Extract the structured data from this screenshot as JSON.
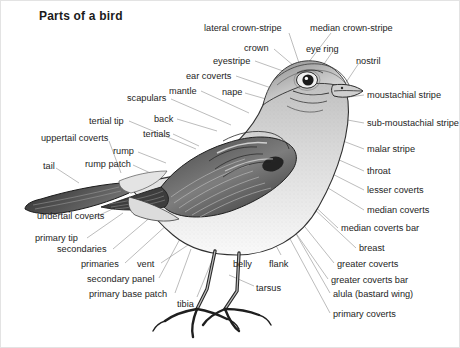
{
  "page": {
    "title": "Parts of a bird",
    "background": "#ffffff",
    "width": 460,
    "height": 348,
    "line_color": "#8e8e8e",
    "text_color": "#242424"
  },
  "labels": [
    {
      "id": "lateral-crown-stripe",
      "text": "lateral crown-stripe",
      "x": 203,
      "y": 22,
      "align": "left",
      "lx": 288,
      "ly": 32,
      "tx": 300,
      "ty": 68
    },
    {
      "id": "median-crown-stripe",
      "text": "median crown-stripe",
      "x": 309,
      "y": 22,
      "align": "left",
      "lx": 330,
      "ly": 32,
      "tx": 307,
      "ty": 62
    },
    {
      "id": "crown",
      "text": "crown",
      "x": 243,
      "y": 42,
      "align": "left",
      "lx": 273,
      "ly": 48,
      "tx": 293,
      "ty": 65
    },
    {
      "id": "eye-ring",
      "text": "eye ring",
      "x": 305,
      "y": 43,
      "align": "left",
      "lx": 332,
      "ly": 50,
      "tx": 316,
      "ty": 73
    },
    {
      "id": "eyestripe",
      "text": "eyestripe",
      "x": 212,
      "y": 55,
      "align": "left",
      "lx": 254,
      "ly": 60,
      "tx": 296,
      "ty": 75
    },
    {
      "id": "nostril",
      "text": "nostril",
      "x": 355,
      "y": 55,
      "align": "left",
      "lx": 358,
      "ly": 62,
      "tx": 344,
      "ty": 83
    },
    {
      "id": "ear-coverts",
      "text": "ear coverts",
      "x": 185,
      "y": 70,
      "align": "left",
      "lx": 235,
      "ly": 75,
      "tx": 285,
      "ty": 92
    },
    {
      "id": "mantle",
      "text": "mantle",
      "x": 168,
      "y": 85,
      "align": "left",
      "lx": 200,
      "ly": 90,
      "tx": 248,
      "ty": 112
    },
    {
      "id": "nape",
      "text": "nape",
      "x": 221,
      "y": 86,
      "align": "left",
      "lx": 244,
      "ly": 92,
      "tx": 272,
      "ty": 100
    },
    {
      "id": "scapulars",
      "text": "scapulars",
      "x": 126,
      "y": 92,
      "align": "left",
      "lx": 170,
      "ly": 98,
      "tx": 230,
      "ty": 124
    },
    {
      "id": "moustachial-stripe",
      "text": "moustachial stripe",
      "x": 366,
      "y": 89,
      "align": "left",
      "lx": 363,
      "ly": 94,
      "tx": 318,
      "ty": 100
    },
    {
      "id": "back",
      "text": "back",
      "x": 153,
      "y": 113,
      "align": "left",
      "lx": 176,
      "ly": 118,
      "tx": 216,
      "ty": 130
    },
    {
      "id": "sub-moustachial-stripe",
      "text": "sub-moustachial stripe",
      "x": 366,
      "y": 117,
      "align": "left",
      "lx": 363,
      "ly": 122,
      "tx": 308,
      "ty": 112
    },
    {
      "id": "tertial-tip",
      "text": "tertial tip",
      "x": 88,
      "y": 115,
      "align": "left",
      "lx": 128,
      "ly": 120,
      "tx": 195,
      "ty": 148
    },
    {
      "id": "tertials",
      "text": "tertials",
      "x": 142,
      "y": 128,
      "align": "left",
      "lx": 172,
      "ly": 133,
      "tx": 198,
      "ty": 145
    },
    {
      "id": "uppertail-coverts",
      "text": "uppertail coverts",
      "x": 40,
      "y": 132,
      "align": "left",
      "lx": 108,
      "ly": 140,
      "tx": 120,
      "ty": 172
    },
    {
      "id": "rump",
      "text": "rump",
      "x": 112,
      "y": 145,
      "align": "left",
      "lx": 137,
      "ly": 151,
      "tx": 165,
      "ty": 162
    },
    {
      "id": "malar-stripe",
      "text": "malar stripe",
      "x": 366,
      "y": 143,
      "align": "left",
      "lx": 363,
      "ly": 148,
      "tx": 300,
      "ty": 124
    },
    {
      "id": "rump-patch",
      "text": "rump patch",
      "x": 84,
      "y": 158,
      "align": "left",
      "lx": 132,
      "ly": 164,
      "tx": 158,
      "ty": 176
    },
    {
      "id": "tail",
      "text": "tail",
      "x": 42,
      "y": 160,
      "align": "left",
      "lx": 55,
      "ly": 167,
      "tx": 78,
      "ty": 182
    },
    {
      "id": "throat",
      "text": "throat",
      "x": 366,
      "y": 165,
      "align": "left",
      "lx": 363,
      "ly": 170,
      "tx": 300,
      "ty": 142
    },
    {
      "id": "lesser-coverts",
      "text": "lesser coverts",
      "x": 366,
      "y": 184,
      "align": "left",
      "lx": 363,
      "ly": 189,
      "tx": 286,
      "ty": 150
    },
    {
      "id": "median-coverts",
      "text": "median coverts",
      "x": 366,
      "y": 204,
      "align": "left",
      "lx": 363,
      "ly": 209,
      "tx": 283,
      "ty": 160
    },
    {
      "id": "undertail-coverts",
      "text": "undertail coverts",
      "x": 36,
      "y": 210,
      "align": "left",
      "lx": 88,
      "ly": 219,
      "tx": 118,
      "ty": 205
    },
    {
      "id": "median-coverts-bar",
      "text": "median coverts bar",
      "x": 340,
      "y": 222,
      "align": "left",
      "lx": 337,
      "ly": 227,
      "tx": 278,
      "ty": 172
    },
    {
      "id": "primary-tip",
      "text": "primary tip",
      "x": 34,
      "y": 232,
      "align": "left",
      "lx": 86,
      "ly": 237,
      "tx": 122,
      "ty": 212
    },
    {
      "id": "breast",
      "text": "breast",
      "x": 358,
      "y": 242,
      "align": "left",
      "lx": 355,
      "ly": 247,
      "tx": 296,
      "ty": 192
    },
    {
      "id": "secondaries",
      "text": "secondaries",
      "x": 56,
      "y": 243,
      "align": "left",
      "lx": 112,
      "ly": 248,
      "tx": 152,
      "ty": 214
    },
    {
      "id": "belly",
      "text": "belly",
      "x": 232,
      "y": 258,
      "align": "left",
      "lx": 246,
      "ly": 254,
      "tx": 238,
      "ty": 226
    },
    {
      "id": "flank",
      "text": "flank",
      "x": 268,
      "y": 258,
      "align": "left",
      "lx": 280,
      "ly": 254,
      "tx": 263,
      "ty": 222
    },
    {
      "id": "primaries",
      "text": "primaries",
      "x": 80,
      "y": 258,
      "align": "left",
      "lx": 124,
      "ly": 262,
      "tx": 168,
      "ty": 222
    },
    {
      "id": "vent",
      "text": "vent",
      "x": 136,
      "y": 258,
      "align": "left",
      "lx": 160,
      "ly": 262,
      "tx": 196,
      "ty": 238
    },
    {
      "id": "greater-coverts",
      "text": "greater coverts",
      "x": 336,
      "y": 258,
      "align": "left",
      "lx": 333,
      "ly": 262,
      "tx": 288,
      "ty": 206
    },
    {
      "id": "secondary-panel",
      "text": "secondary panel",
      "x": 86,
      "y": 273,
      "align": "left",
      "lx": 158,
      "ly": 277,
      "tx": 180,
      "ty": 236
    },
    {
      "id": "greater-coverts-bar",
      "text": "greater coverts bar",
      "x": 330,
      "y": 274,
      "align": "left",
      "lx": 327,
      "ly": 278,
      "tx": 285,
      "ty": 218
    },
    {
      "id": "primary-base-patch",
      "text": "primary base patch",
      "x": 88,
      "y": 288,
      "align": "left",
      "lx": 174,
      "ly": 292,
      "tx": 190,
      "ty": 248
    },
    {
      "id": "alula-bastard-wing",
      "text": "alula (bastard wing)",
      "x": 332,
      "y": 288,
      "align": "left",
      "lx": 329,
      "ly": 292,
      "tx": 290,
      "ty": 224
    },
    {
      "id": "tibia",
      "text": "tibia",
      "x": 176,
      "y": 298,
      "align": "left",
      "lx": 196,
      "ly": 296,
      "tx": 210,
      "ty": 262
    },
    {
      "id": "tarsus",
      "text": "tarsus",
      "x": 255,
      "y": 282,
      "align": "left",
      "lx": 253,
      "ly": 285,
      "tx": 228,
      "ty": 274
    },
    {
      "id": "primary-coverts",
      "text": "primary coverts",
      "x": 332,
      "y": 308,
      "align": "left",
      "lx": 329,
      "ly": 312,
      "tx": 288,
      "ty": 236
    }
  ]
}
